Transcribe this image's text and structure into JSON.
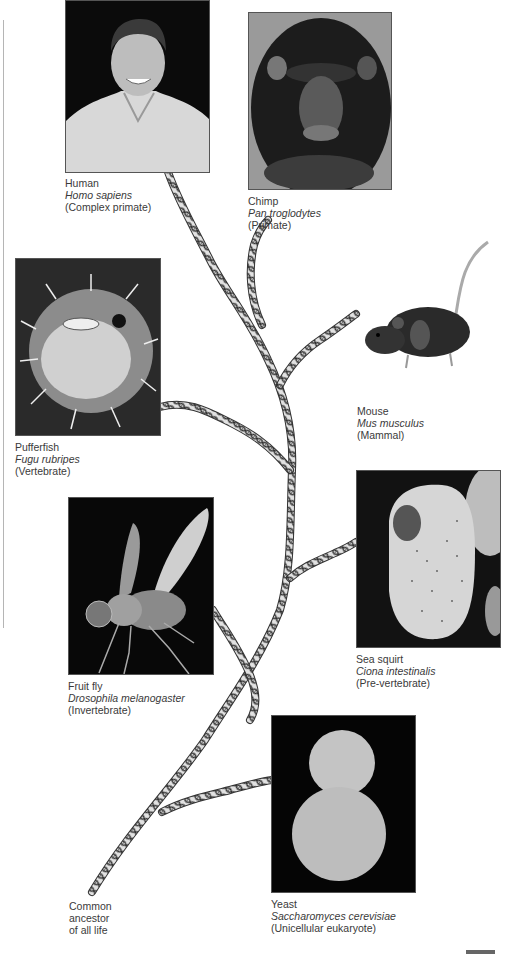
{
  "figure": {
    "type": "evolutionary tree of sequenced genomes",
    "organisms": [
      {
        "id": "human",
        "common": "Human",
        "scientific": "Homo sapiens",
        "class": "(Complex primate)"
      },
      {
        "id": "chimp",
        "common": "Chimp",
        "scientific": "Pan troglodytes",
        "class": "(Primate)"
      },
      {
        "id": "pufferfish",
        "common": "Pufferfish",
        "scientific": "Fugu rubripes",
        "class": "(Vertebrate)"
      },
      {
        "id": "mouse",
        "common": "Mouse",
        "scientific": "Mus musculus",
        "class": "(Mammal)"
      },
      {
        "id": "fruitfly",
        "common": "Fruit fly",
        "scientific": "Drosophila melanogaster",
        "class": "(Invertebrate)"
      },
      {
        "id": "seasquirt",
        "common": "Sea squirt",
        "scientific": "Ciona intestinalis",
        "class": "(Pre-vertebrate)"
      },
      {
        "id": "yeast",
        "common": "Yeast",
        "scientific": "Saccharomyces cerevisiae",
        "class": "(Unicellular eukaryote)"
      }
    ],
    "root": {
      "line1": "Common",
      "line2": "ancestor",
      "line3": "of all life"
    },
    "branch_style": "dna-double-helix",
    "colors": {
      "helix_stroke": "#333333",
      "helix_fill": "#d9d9d9",
      "photo_bg": "#111111",
      "text": "#3a3a3a"
    }
  }
}
